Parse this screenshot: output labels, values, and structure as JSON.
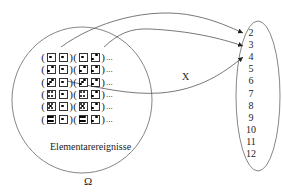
{
  "diagram": {
    "sample_space": {
      "label": "Ω",
      "caption": "Elementarereignisse",
      "rows": [
        {
          "pairs": [
            [
              1,
              1
            ],
            [
              1,
              2
            ]
          ],
          "ellipsis": "..."
        },
        {
          "pairs": [
            [
              2,
              1
            ],
            [
              2,
              2
            ]
          ],
          "ellipsis": "..."
        },
        {
          "pairs": [
            [
              3,
              1
            ],
            [
              3,
              2
            ]
          ],
          "ellipsis": "..."
        },
        {
          "pairs": [
            [
              4,
              1
            ],
            [
              4,
              2
            ]
          ],
          "ellipsis": "..."
        },
        {
          "pairs": [
            [
              5,
              1
            ],
            [
              5,
              2
            ]
          ],
          "ellipsis": "..."
        },
        {
          "pairs": [
            [
              6,
              1
            ],
            [
              6,
              2
            ]
          ],
          "ellipsis": "..."
        }
      ]
    },
    "mapping_label": "X",
    "codomain": {
      "values": [
        "2",
        "3",
        "4",
        "5",
        "6",
        "7",
        "8",
        "9",
        "10",
        "11",
        "12"
      ]
    },
    "arrows": [
      {
        "from": "(1,1)",
        "to": "2"
      },
      {
        "from": "(1,2)",
        "to": "3"
      },
      {
        "from": "(3,1)",
        "to": "4"
      }
    ],
    "colors": {
      "line": "#555555",
      "text": "#222222",
      "background": "#ffffff"
    }
  }
}
